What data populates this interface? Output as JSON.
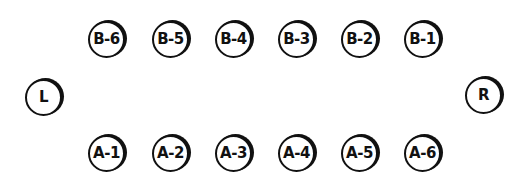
{
  "diagram": {
    "type": "seating-layout",
    "colors": {
      "stroke": "#111111",
      "background": "#ffffff"
    },
    "row_b": [
      {
        "label": "B-6",
        "cx": 106,
        "cy": 39
      },
      {
        "label": "B-5",
        "cx": 170,
        "cy": 39
      },
      {
        "label": "B-4",
        "cx": 233,
        "cy": 39
      },
      {
        "label": "B-3",
        "cx": 296,
        "cy": 39
      },
      {
        "label": "B-2",
        "cx": 359,
        "cy": 39
      },
      {
        "label": "B-1",
        "cx": 422,
        "cy": 39
      }
    ],
    "row_a": [
      {
        "label": "A-1",
        "cx": 106,
        "cy": 153
      },
      {
        "label": "A-2",
        "cx": 170,
        "cy": 153
      },
      {
        "label": "A-3",
        "cx": 233,
        "cy": 153
      },
      {
        "label": "A-4",
        "cx": 296,
        "cy": 153
      },
      {
        "label": "A-5",
        "cx": 359,
        "cy": 153
      },
      {
        "label": "A-6",
        "cx": 422,
        "cy": 153
      }
    ],
    "left": {
      "label": "L",
      "cx": 43,
      "cy": 97
    },
    "right": {
      "label": "R",
      "cx": 483,
      "cy": 95
    }
  }
}
